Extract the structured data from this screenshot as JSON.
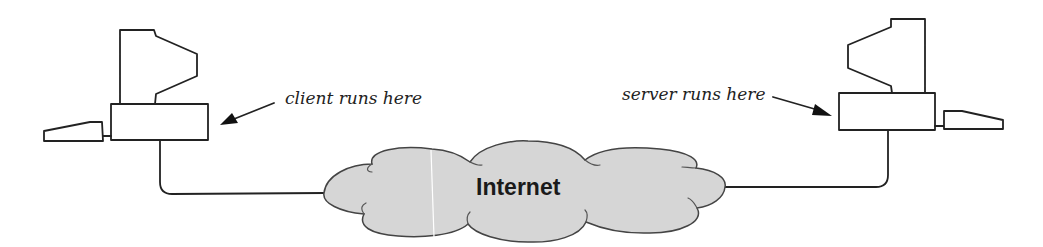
{
  "diagram": {
    "client": {
      "label": "client runs here",
      "icon": "desktop-computer-icon"
    },
    "server": {
      "label": "server runs here",
      "icon": "desktop-computer-icon"
    },
    "network": {
      "label": "Internet",
      "icon": "cloud-icon",
      "fill_color": "#d6d6d6"
    },
    "connections": [
      {
        "from": "client",
        "to": "network"
      },
      {
        "from": "network",
        "to": "server"
      }
    ]
  }
}
